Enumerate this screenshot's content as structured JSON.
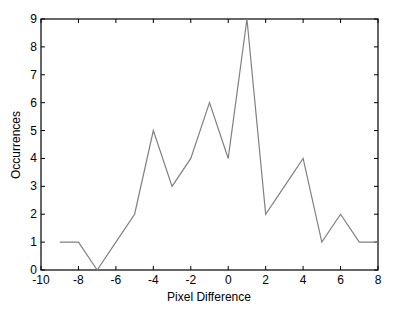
{
  "chart_data": {
    "type": "line",
    "title": "",
    "xlabel": "Pixel Difference",
    "ylabel": "Occurrences",
    "xlim": [
      -10,
      8
    ],
    "ylim": [
      0,
      9
    ],
    "xticks": [
      "-10",
      "-8",
      "-6",
      "-4",
      "-2",
      "0",
      "2",
      "4",
      "6",
      "8"
    ],
    "yticks": [
      "0",
      "1",
      "2",
      "3",
      "4",
      "5",
      "6",
      "7",
      "8",
      "9"
    ],
    "grid": false,
    "legend": null,
    "x": [
      -9,
      -8,
      -7,
      -6,
      -5,
      -4,
      -3,
      -2,
      -1,
      0,
      1,
      2,
      3,
      4,
      5,
      6,
      7,
      8
    ],
    "series": [
      {
        "name": "Occurrences",
        "color": "#808080",
        "values": [
          1,
          1,
          0,
          1,
          2,
          5,
          3,
          4,
          6,
          4,
          9,
          2,
          3,
          4,
          1,
          2,
          1,
          1
        ]
      }
    ]
  }
}
